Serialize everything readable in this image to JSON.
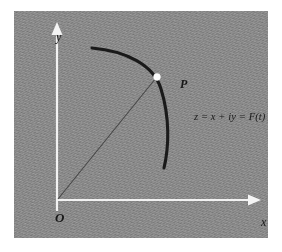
{
  "figure": {
    "kind": "complex-plane-parametric-curve-diagram",
    "background_color": "#ffffff",
    "panel_color": "#8e8e8e",
    "ink_color": "#1a1a1a",
    "axis_color": "#f2f2f2",
    "labels": {
      "y_axis": "y",
      "x_axis": "x",
      "origin": "O",
      "point": "P",
      "equation": "z = x + iy = F(t)"
    },
    "icons": {
      "y_arrow": "arrow-up-icon",
      "x_arrow": "arrow-right-icon",
      "point_dot": "point-marker-icon"
    }
  }
}
